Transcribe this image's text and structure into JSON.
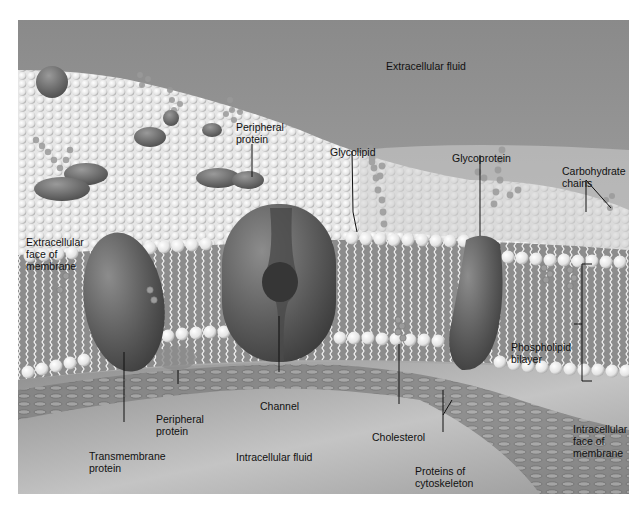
{
  "diagram": {
    "regions": {
      "top": "Extracellular fluid",
      "bottom": "Intracellular fluid"
    },
    "labels": {
      "peripheral_protein_top": [
        "Peripheral",
        "protein"
      ],
      "glycolipid": [
        "Glycolipid"
      ],
      "glycoprotein": [
        "Glycoprotein"
      ],
      "carbohydrate_chains": [
        "Carbohydrate",
        "chains"
      ],
      "extracellular_face": [
        "Extracellular",
        "face of",
        "membrane"
      ],
      "phospholipid_bilayer": [
        "Phospholipid",
        "bilayer"
      ],
      "channel": [
        "Channel"
      ],
      "peripheral_protein_bottom": [
        "Peripheral",
        "protein"
      ],
      "transmembrane_protein": [
        "Transmembrane",
        "protein"
      ],
      "cholesterol": [
        "Cholesterol"
      ],
      "intracellular_face": [
        "Intracellular",
        "face of",
        "membrane"
      ],
      "proteins_of_cytoskeleton": [
        "Proteins of",
        "cytoskeleton"
      ]
    },
    "colors": {
      "fluid_top": "#8e8e8e",
      "fluid_bottom": "#a9a9a9",
      "bilayer_core": "#8a8a8a",
      "lipid_head": "#f2f2f2",
      "protein": "#5e5e5e",
      "label_text": "#111111"
    }
  }
}
